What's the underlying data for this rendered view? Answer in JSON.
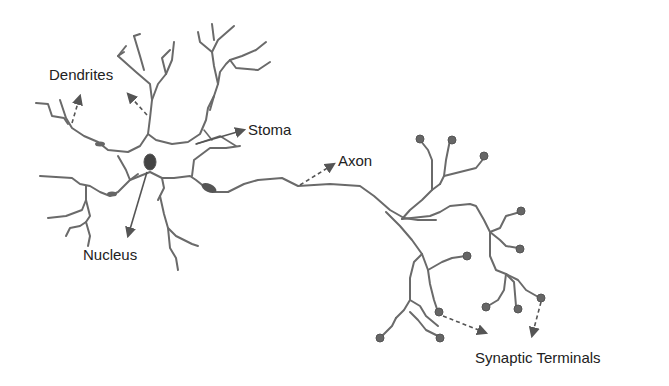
{
  "diagram": {
    "labels": {
      "dendrites": "Dendrites",
      "stoma": "Stoma",
      "axon": "Axon",
      "nucleus": "Nucleus",
      "synaptic_terminals": "Synaptic Terminals"
    },
    "colors": {
      "neuron_stroke": "#6a6a6a",
      "arrow": "#555555",
      "text": "#222222",
      "background": "#ffffff"
    }
  }
}
